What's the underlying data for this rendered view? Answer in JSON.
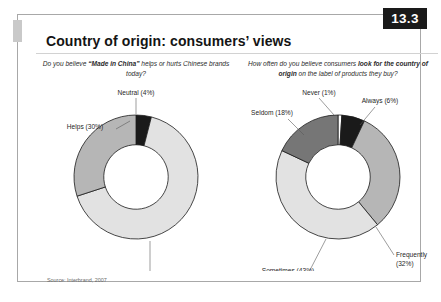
{
  "figure": {
    "number": "13.3",
    "title": "Country of origin: consumers’ views",
    "source": "Source: Interbrand, 2007"
  },
  "panels": {
    "left": {
      "question_plain_1": "Do you believe ",
      "question_bold": "“Made in China”",
      "question_plain_2": " helps or hurts Chinese brands today?"
    },
    "right": {
      "question_plain_1": "How often do you believe consumers ",
      "question_bold": "look for the country of origin",
      "question_plain_2": " on the label of products they buy?"
    }
  },
  "chart_data": [
    {
      "type": "pie",
      "title": "Do you believe “Made in China” helps or hurts Chinese brands today?",
      "donut": true,
      "hole_ratio": 0.52,
      "start_angle": -90,
      "labels": [
        "Neutral (4%)",
        "Hurts (66%)",
        "Helps (30%)"
      ],
      "categories": [
        "Neutral",
        "Hurts",
        "Helps"
      ],
      "values": [
        4,
        66,
        30
      ],
      "colors": [
        "#1a1a1a",
        "#e2e2e2",
        "#b6b6b6"
      ],
      "label_positions": [
        {
          "name": "Neutral",
          "text": "Neutral (4%)",
          "x": 98,
          "y": 14,
          "anchor": "middle"
        },
        {
          "name": "Hurts",
          "text": "Hurts (66%)",
          "x": 112,
          "y": 196,
          "anchor": "middle"
        },
        {
          "name": "Helps",
          "text": "Helps (30%)",
          "x": 47,
          "y": 48,
          "anchor": "middle"
        }
      ]
    },
    {
      "type": "pie",
      "title": "How often do you believe consumers look for the country of origin on the label of products they buy?",
      "donut": true,
      "hole_ratio": 0.52,
      "start_angle": -90,
      "labels": [
        "Never (1%)",
        "Always (6%)",
        "Frequently (32%)",
        "Sometimes (43%)",
        "Seldom (18%)"
      ],
      "categories": [
        "Never",
        "Always",
        "Frequently",
        "Sometimes",
        "Seldom"
      ],
      "values": [
        1,
        6,
        32,
        43,
        18
      ],
      "colors": [
        "#ffffff",
        "#1a1a1a",
        "#b6b6b6",
        "#e2e2e2",
        "#767676"
      ],
      "label_positions": [
        {
          "name": "Never",
          "text": "Never (1%)",
          "x": 79,
          "y": 14,
          "anchor": "middle"
        },
        {
          "name": "Always",
          "text": "Always (6%)",
          "x": 140,
          "y": 22,
          "anchor": "middle"
        },
        {
          "name": "Frequently",
          "text": "Frequently",
          "x": 156,
          "y": 176,
          "anchor": "start"
        },
        {
          "name": "Frequently-pct",
          "text": "(32%)",
          "x": 156,
          "y": 185,
          "anchor": "start"
        },
        {
          "name": "Sometimes",
          "text": "Sometimes (43%)",
          "x": 48,
          "y": 192,
          "anchor": "middle"
        },
        {
          "name": "Seldom",
          "text": "Seldom (18%)",
          "x": 32,
          "y": 34,
          "anchor": "middle"
        }
      ]
    }
  ]
}
